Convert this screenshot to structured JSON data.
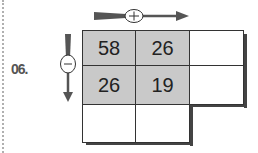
{
  "exercise": {
    "number": "06.",
    "plus_symbol": "+",
    "minus_symbol": "−",
    "grid": [
      [
        "58",
        "26",
        ""
      ],
      [
        "26",
        "19",
        ""
      ],
      [
        "",
        ""
      ]
    ]
  },
  "colors": {
    "shaded": "#c9c9c9",
    "arrow": "#555555",
    "border": "#333333"
  }
}
